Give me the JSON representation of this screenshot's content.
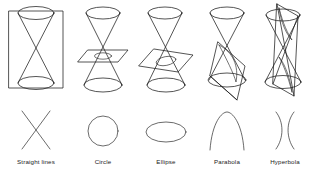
{
  "figure": {
    "background_color": "#ffffff",
    "line_color": "#1c1c1c",
    "text_color": "#1a1a1a",
    "width": 314,
    "height": 182
  },
  "panels": [
    {
      "id": "straight-lines",
      "label": "Straight lines",
      "cut_type": "plane through the apex, containing the axis",
      "resulting_curve": "two intersecting straight lines",
      "plane_shape": "vertical rectangle",
      "curve_glyph": "X"
    },
    {
      "id": "circle",
      "label": "Circle",
      "cut_type": "plane perpendicular to the axis",
      "resulting_curve": "circle",
      "plane_shape": "horizontal parallelogram",
      "curve_glyph": "O"
    },
    {
      "id": "ellipse",
      "label": "Ellipse",
      "cut_type": "plane oblique to the axis, cutting one nappe completely",
      "resulting_curve": "ellipse",
      "plane_shape": "tilted parallelogram",
      "curve_glyph": "oval"
    },
    {
      "id": "parabola",
      "label": "Parabola",
      "cut_type": "plane parallel to one generator of the cone",
      "resulting_curve": "parabola",
      "plane_shape": "steeply tilted parallelogram",
      "curve_glyph": "arch"
    },
    {
      "id": "hyperbola",
      "label": "Hyperbola",
      "cut_type": "plane parallel to the axis, cutting both nappes",
      "resulting_curve": "hyperbola (two branches)",
      "plane_shape": "near-vertical parallelogram",
      "curve_glyph": ")("
    }
  ]
}
